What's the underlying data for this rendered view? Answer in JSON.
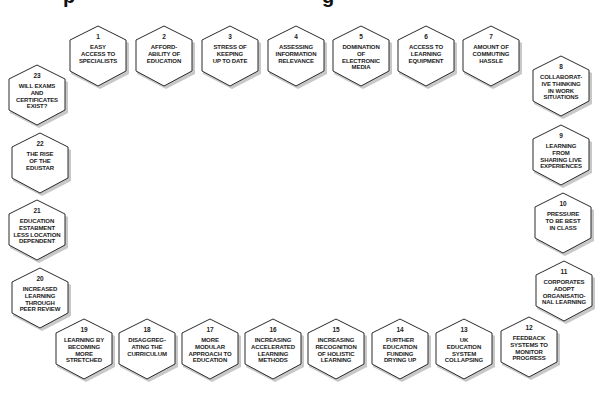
{
  "diagram": {
    "title_fragments": [
      "p",
      "g"
    ],
    "style": {
      "hex_fill": "#ffffff",
      "hex_stroke": "#2a2a2a",
      "hex_shadow": "#9a9a9a",
      "text_color": "#1a1a1a",
      "background": "#ffffff"
    },
    "nodes": [
      {
        "num": "1",
        "label": "EASY\nACCESS TO\nSPECIALISTS",
        "cx": 98,
        "cy": 56
      },
      {
        "num": "2",
        "label": "AFFORD-\nABILITY OF\nEDUCATION",
        "cx": 164,
        "cy": 56
      },
      {
        "num": "3",
        "label": "STRESS OF\nKEEPING\nUP TO DATE",
        "cx": 230,
        "cy": 56
      },
      {
        "num": "4",
        "label": "ASSESSING\nINFORMATION\nRELEVANCE",
        "cx": 296,
        "cy": 56
      },
      {
        "num": "5",
        "label": "DOMINATION\nOF\nELECTRONIC\nMEDIA",
        "cx": 361,
        "cy": 56
      },
      {
        "num": "6",
        "label": "ACCESS TO\nLEARNING\nEQUIPMENT",
        "cx": 426,
        "cy": 56
      },
      {
        "num": "7",
        "label": "AMOUNT OF\nCOMMUTING\nHASSLE",
        "cx": 491,
        "cy": 56
      },
      {
        "num": "8",
        "label": "COLLABORAT-\nIVE THINKING\nIN WORK\nSITUATIONS",
        "cx": 561,
        "cy": 86
      },
      {
        "num": "9",
        "label": "LEARNING\nFROM\nSHARING LIVE\nEXPERIENCES",
        "cx": 561,
        "cy": 155
      },
      {
        "num": "10",
        "label": "PRESSURE\nTO BE BEST\nIN CLASS",
        "cx": 563,
        "cy": 223
      },
      {
        "num": "11",
        "label": "CORPORATES\nADOPT\nORGANISATIO-\nNAL LEARNING",
        "cx": 564,
        "cy": 291
      },
      {
        "num": "12",
        "label": "FEEDBACK\nSYSTEMS TO\nMONITOR\nPROGRESS",
        "cx": 529,
        "cy": 347
      },
      {
        "num": "13",
        "label": "UK\nEDUCATION\nSYSTEM\nCOLLAPSING",
        "cx": 464,
        "cy": 349
      },
      {
        "num": "14",
        "label": "FURTHER\nEDUCATION\nFUNDING\nDRYING UP",
        "cx": 400,
        "cy": 349
      },
      {
        "num": "15",
        "label": "INCREASING\nRECOGNITION\nOF HOLISTIC\nLEARNING",
        "cx": 336,
        "cy": 349
      },
      {
        "num": "16",
        "label": "INCREASING\nACCELERATED\nLEARNING\nMETHODS",
        "cx": 273,
        "cy": 349
      },
      {
        "num": "17",
        "label": "MORE\nMODULAR\nAPPROACH TO\nEDUCATION",
        "cx": 210,
        "cy": 349
      },
      {
        "num": "18",
        "label": "DISAGGREG-\nATING THE\nCURRICULUM",
        "cx": 147,
        "cy": 349
      },
      {
        "num": "19",
        "label": "LEARNING BY\nBECOMING\nMORE\nSTRETCHED",
        "cx": 84,
        "cy": 349
      },
      {
        "num": "20",
        "label": "INCREASED\nLEARNING\nTHROUGH\nPEER REVIEW",
        "cx": 40,
        "cy": 298
      },
      {
        "num": "21",
        "label": "EDUCATION\nESTABMENT\nLESS LOCATION\nDEPENDENT",
        "cx": 37,
        "cy": 230
      },
      {
        "num": "22",
        "label": "THE RISE\nOF THE\nEDUSTAR",
        "cx": 40,
        "cy": 163
      },
      {
        "num": "23",
        "label": "WILL EXAMS\nAND\nCERTIFICATES\nEXIST?",
        "cx": 37,
        "cy": 95
      }
    ]
  }
}
